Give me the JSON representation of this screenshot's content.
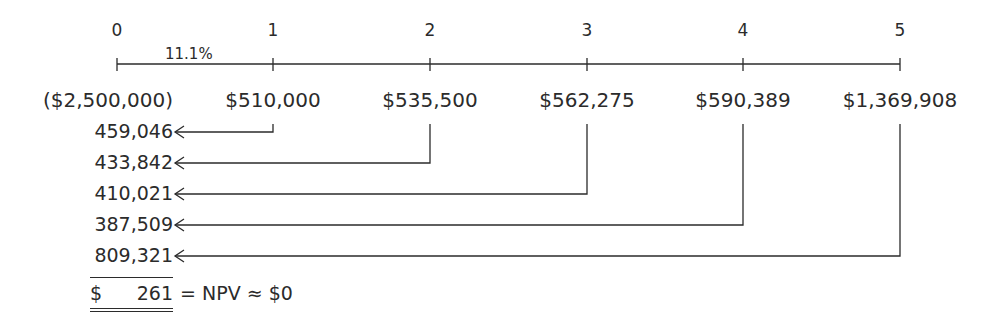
{
  "diagram": {
    "type": "npv-timeline",
    "rate_label": "11.1%",
    "periods": [
      {
        "label": "0",
        "cash_flow": "($2,500,000)",
        "x": 117
      },
      {
        "label": "1",
        "cash_flow": "$510,000",
        "x": 273
      },
      {
        "label": "2",
        "cash_flow": "$535,500",
        "x": 430
      },
      {
        "label": "3",
        "cash_flow": "$562,275",
        "x": 587
      },
      {
        "label": "4",
        "cash_flow": "$590,389",
        "x": 743
      },
      {
        "label": "5",
        "cash_flow": "$1,369,908",
        "x": 900
      }
    ],
    "present_values": [
      {
        "value": "459,046",
        "from_period": 1,
        "y": 132
      },
      {
        "value": "433,842",
        "from_period": 2,
        "y": 163
      },
      {
        "value": "410,021",
        "from_period": 3,
        "y": 194
      },
      {
        "value": "387,509",
        "from_period": 4,
        "y": 225
      },
      {
        "value": "809,321",
        "from_period": 5,
        "y": 256
      }
    ],
    "total": {
      "currency": "$",
      "value": "261",
      "equation": "= NPV ≈ $0"
    }
  },
  "colors": {
    "ink": "#2b2b2b",
    "background": "#ffffff"
  }
}
